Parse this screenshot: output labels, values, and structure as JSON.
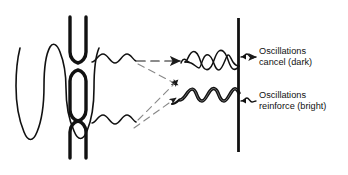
{
  "figure": {
    "background_color": "#ffffff",
    "ink_color": "#111111",
    "ray_color": "#555555"
  },
  "elements": {
    "incoming_wave": {
      "name": "incoming plane wave",
      "cycles": 3,
      "orientation": "vertical"
    },
    "barrier": {
      "name": "double-slit barrier",
      "slit_count": 2,
      "color": "#111111"
    },
    "slit_wavelets": [
      {
        "name": "upper-slit wavelet",
        "cycles": 2
      },
      {
        "name": "lower-slit wavelet",
        "cycles": 2
      }
    ],
    "screen": {
      "name": "detection screen",
      "color": "#111111"
    },
    "interference_waves": [
      {
        "name": "destructive interference wave",
        "style": "crossing out-of-phase pair"
      },
      {
        "name": "constructive interference wave",
        "style": "thick reinforced wave"
      }
    ]
  },
  "labels": {
    "cancel": {
      "line1": "Oscillations",
      "line2": "cancel (dark)"
    },
    "reinforce": {
      "line1": "Oscillations",
      "line2": "reinforce (bright)"
    }
  }
}
